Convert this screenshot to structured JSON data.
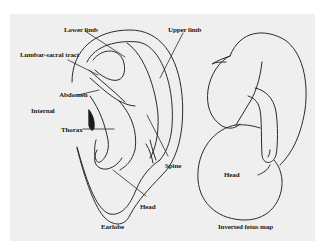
{
  "figure": {
    "background_color": "#efefef",
    "stroke_color": "#2a2a2a",
    "ear": {
      "labels": {
        "lower_limb": "Lower limb",
        "upper_limb": "Upper limb",
        "lumbar_sacral": "Lumbar-sacral tract",
        "abdomen": "Abdomen",
        "internal": "Internal",
        "thorax": "Thorax",
        "spine": "Spine",
        "head": "Head",
        "earlobe": "Earlobe"
      }
    },
    "fetus": {
      "labels": {
        "head": "Head",
        "caption": "Inverted fetus map"
      }
    }
  }
}
